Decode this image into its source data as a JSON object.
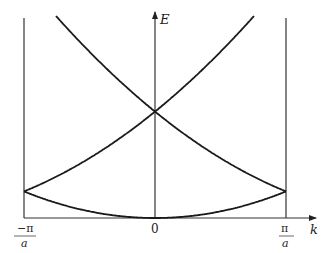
{
  "figure": {
    "axis_labels": {
      "y": "E",
      "x": "k"
    },
    "tick_labels": {
      "left_num": "−π",
      "left_den": "a",
      "center": "0",
      "right_num": "π",
      "right_den": "a"
    },
    "colors": {
      "curve": "#1a1a1a",
      "axis": "#333333",
      "background": "#ffffff"
    }
  },
  "chart_data": {
    "type": "line",
    "title": "",
    "xlabel": "k",
    "ylabel": "E",
    "x_ticks": [
      "-π/a",
      "0",
      "π/a"
    ],
    "xlim": [
      "-π/a",
      "π/a"
    ],
    "grid": false,
    "legend": null,
    "series": [
      {
        "name": "band 1: E ∝ k²",
        "x_range": [
          "-π/a",
          "π/a"
        ],
        "E_at_k0": 0,
        "E_at_zone_edge": 0.25
      },
      {
        "name": "band 2: E ∝ (k - 2π/a)² for k<0 branch / (k + 2π/a)² mirrored",
        "E_at_zone_edge": 0.25,
        "E_at_k0": 1.0
      },
      {
        "name": "band 2 (mirror): E ∝ (k + 2π/a)²",
        "E_at_zone_edge": 0.25,
        "E_at_k0": 1.0
      },
      {
        "name": "band 3 continuation beyond crossing at k=0",
        "E_at_k0": 1.0,
        "E_top_of_plot": 2.0
      }
    ],
    "annotations": [
      "Bands cross at k=0, E=1 (units of (ħ²/2m)(2π/a)²/... scaled)",
      "Vertical lines at zone boundaries k=±π/a"
    ]
  }
}
